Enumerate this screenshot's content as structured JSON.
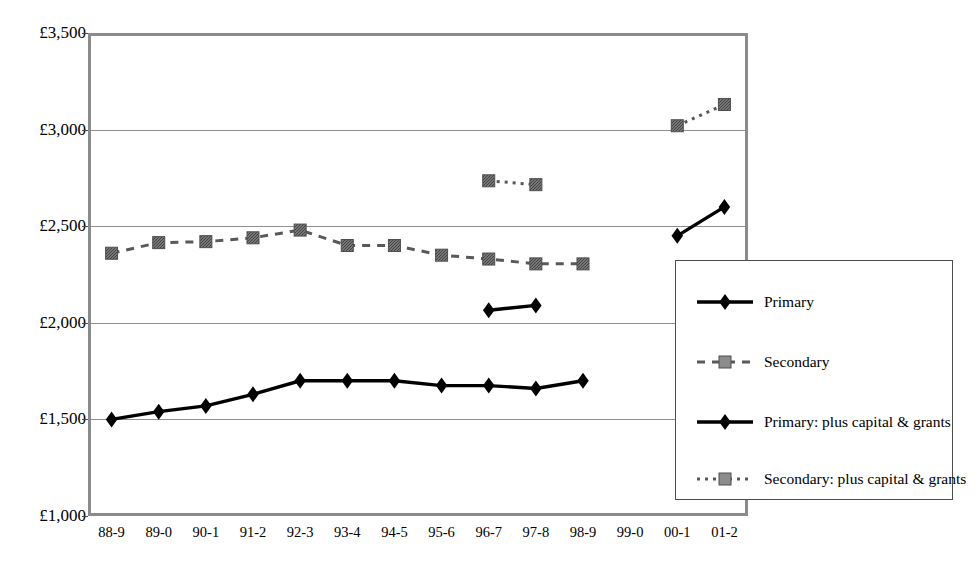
{
  "top_bleed_text": "descender remnants of preceding text line",
  "chart_data": {
    "type": "line",
    "title": "",
    "xlabel": "",
    "ylabel": "",
    "ylim": [
      1000,
      3500
    ],
    "ytick_step": 500,
    "ytick_labels": [
      "£3,500",
      "£3,000",
      "£2,500",
      "£2,000",
      "£1,500",
      "£1,000"
    ],
    "ytick_values": [
      3500,
      3000,
      2500,
      2000,
      1500,
      1000
    ],
    "grid": true,
    "legend_position": "bottom-right",
    "categories": [
      "88-9",
      "89-0",
      "90-1",
      "91-2",
      "92-3",
      "93-4",
      "94-5",
      "95-6",
      "96-7",
      "97-8",
      "98-9",
      "99-0",
      "00-1",
      "01-2"
    ],
    "series": [
      {
        "name": "Primary",
        "marker": "diamond",
        "line": "solid",
        "color": "#000000",
        "values": [
          1500,
          1540,
          1570,
          1630,
          1700,
          1700,
          1700,
          1675,
          1675,
          1660,
          1700,
          null,
          null,
          null
        ]
      },
      {
        "name": "Secondary",
        "marker": "square",
        "line": "dashed",
        "color": "#595959",
        "values": [
          2360,
          2415,
          2420,
          2440,
          2480,
          2400,
          2400,
          2350,
          2330,
          2305,
          2305,
          null,
          null,
          null
        ]
      },
      {
        "name": "Primary:  plus capital & grants",
        "marker": "diamond",
        "line": "solid",
        "color": "#000000",
        "values": [
          null,
          null,
          null,
          null,
          null,
          null,
          null,
          null,
          2065,
          2090,
          null,
          null,
          2450,
          2600
        ]
      },
      {
        "name": "Secondary: plus capital & grants",
        "marker": "square",
        "line": "dotted",
        "color": "#595959",
        "values": [
          null,
          null,
          null,
          null,
          null,
          null,
          null,
          null,
          2735,
          2715,
          null,
          null,
          3020,
          3130
        ]
      }
    ]
  },
  "legend": {
    "entries": [
      {
        "label": "Primary"
      },
      {
        "label": "Secondary"
      },
      {
        "label": "Primary:  plus capital & grants"
      },
      {
        "label": "Secondary: plus capital & grants"
      }
    ]
  }
}
